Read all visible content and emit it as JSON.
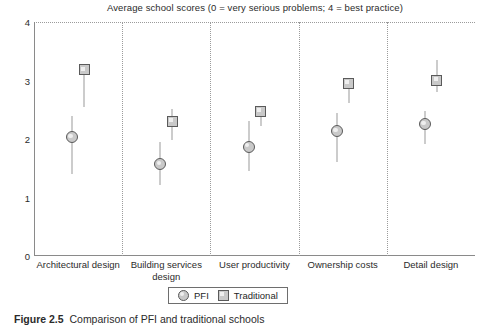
{
  "chart_data": {
    "type": "scatter",
    "title": "Average school scores (0 = very serious problems; 4 = best practice)",
    "xlabel": "",
    "ylabel": "",
    "ylim": [
      0,
      4
    ],
    "yticks": [
      0,
      1,
      2,
      3,
      4
    ],
    "grid": "dotted vertical separators between categories; dotted top line at 4",
    "legend_position": "bottom-center",
    "categories": [
      "Architectural design",
      "Building services design",
      "User productivity",
      "Ownership costs",
      "Detail design"
    ],
    "series": [
      {
        "name": "PFI",
        "marker": "circle",
        "values": [
          2.03,
          1.57,
          1.87,
          2.13,
          2.25
        ],
        "error_low": [
          1.4,
          1.22,
          1.45,
          1.6,
          1.92
        ],
        "error_high": [
          2.4,
          1.95,
          2.3,
          2.45,
          2.48
        ]
      },
      {
        "name": "Traditional",
        "marker": "square",
        "values": [
          3.18,
          2.3,
          2.47,
          2.95,
          3.0
        ],
        "error_low": [
          2.55,
          1.98,
          2.22,
          2.62,
          2.8
        ],
        "error_high": [
          3.22,
          2.52,
          2.56,
          3.02,
          3.35
        ]
      }
    ]
  },
  "legend": {
    "items": [
      {
        "label": "PFI",
        "marker": "circle-marker-icon"
      },
      {
        "label": "Traditional",
        "marker": "square-marker-icon"
      }
    ]
  },
  "caption": {
    "number": "Figure 2.5",
    "text": "Comparison of PFI and traditional schools"
  }
}
